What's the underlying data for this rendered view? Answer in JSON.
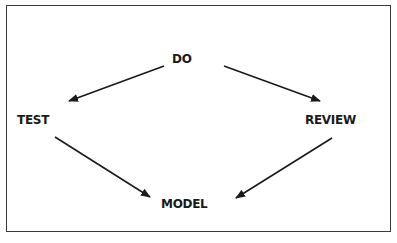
{
  "diagram": {
    "title": "",
    "nodes": [
      {
        "id": "do",
        "label": "DO"
      },
      {
        "id": "test",
        "label": "TEST"
      },
      {
        "id": "review",
        "label": "REVIEW"
      },
      {
        "id": "model",
        "label": "MODEL"
      }
    ],
    "edges": [
      {
        "from": "do",
        "to": "test"
      },
      {
        "from": "do",
        "to": "review"
      },
      {
        "from": "test",
        "to": "model"
      },
      {
        "from": "review",
        "to": "model"
      }
    ],
    "colors": {
      "stroke": "#1a1a1a",
      "frame": "#3a3a3a",
      "background": "#ffffff"
    }
  }
}
